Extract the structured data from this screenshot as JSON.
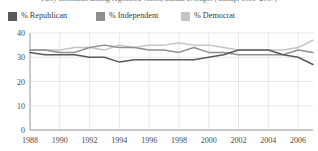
{
  "figure": {
    "title_cutoff": "Party affiliation among registered voters, annual averages (Gallup, 1988–2007)"
  },
  "legend": {
    "position": "top",
    "items": [
      {
        "label": "% Republican",
        "color": "#595959",
        "key": "republican"
      },
      {
        "label": "% Independent",
        "color": "#8f8f8f",
        "key": "independent"
      },
      {
        "label": "% Democrat",
        "color": "#c4c4c4",
        "key": "democrat"
      }
    ]
  },
  "axes": {
    "y_ticks": [
      "0",
      "10",
      "20",
      "30",
      "40"
    ],
    "x_ticks": [
      "1988",
      "1990",
      "1992",
      "1994",
      "1996",
      "1998",
      "2000",
      "2002",
      "2004",
      "2006"
    ]
  },
  "chart_data": {
    "type": "line",
    "title": "Party affiliation among registered voters, annual averages (Gallup, 1988–2007)",
    "xlabel": "",
    "ylabel": "",
    "ylim": [
      0,
      40
    ],
    "xlim": [
      1988,
      2007
    ],
    "grid": true,
    "legend_position": "top",
    "x": [
      1988,
      1989,
      1990,
      1991,
      1992,
      1993,
      1994,
      1995,
      1996,
      1997,
      1998,
      1999,
      2000,
      2001,
      2002,
      2003,
      2004,
      2005,
      2006,
      2007
    ],
    "series": [
      {
        "name": "% Republican",
        "color": "#595959",
        "values": [
          32,
          31,
          31,
          31,
          30,
          30,
          28,
          29,
          29,
          29,
          29,
          29,
          30,
          31,
          33,
          33,
          33,
          31,
          30,
          27
        ]
      },
      {
        "name": "% Independent",
        "color": "#8f8f8f",
        "values": [
          33,
          33,
          32,
          32,
          34,
          35,
          34,
          34,
          33,
          33,
          32,
          34,
          32,
          32,
          31,
          31,
          31,
          31,
          33,
          32
        ]
      },
      {
        "name": "% Democrat",
        "color": "#c4c4c4",
        "values": [
          33,
          33,
          33,
          34,
          34,
          33,
          35,
          34,
          35,
          35,
          36,
          35,
          35,
          34,
          33,
          33,
          33,
          33,
          34,
          37
        ]
      }
    ]
  }
}
